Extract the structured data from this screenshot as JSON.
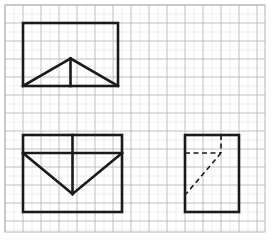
{
  "canvas": {
    "width": 271,
    "height": 240,
    "background": "#ffffff"
  },
  "grid": {
    "name": "square-grid-paper",
    "origin_x": 5,
    "origin_y": 5,
    "frame_width": 260,
    "frame_height": 227,
    "cell_size": 18,
    "sub_divisions": 2,
    "major_line_color": "#b9b9bd",
    "minor_line_color": "#dedee2",
    "frame_color": "#b4b4b8",
    "major_line_width": 0.9,
    "minor_line_width": 0.45,
    "frame_line_width": 1.0
  },
  "style": {
    "stroke_color": "#1a1a1a",
    "solid_stroke_width": 2.6,
    "dashed_stroke_width": 1.6,
    "dash_pattern": "5,3.5",
    "line_cap": "square",
    "fill": "none"
  },
  "figures": [
    {
      "id": "figure-top-left",
      "label": "Rectangle with inscribed isosceles triangle and median",
      "kind": "rectangle-with-triangle",
      "outline": {
        "name": "top-left-rectangle",
        "x": 23,
        "y": 23,
        "width": 95,
        "height": 63,
        "style": "solid"
      },
      "segments": [
        {
          "name": "triangle-left-leg",
          "x1": 23,
          "y1": 86,
          "x2": 70.5,
          "y2": 58.5,
          "style": "solid"
        },
        {
          "name": "triangle-right-leg",
          "x1": 70.5,
          "y1": 58.5,
          "x2": 118,
          "y2": 86,
          "style": "solid"
        },
        {
          "name": "triangle-median-vertical",
          "x1": 70.5,
          "y1": 58.5,
          "x2": 70.5,
          "y2": 86,
          "style": "solid"
        }
      ]
    },
    {
      "id": "figure-bottom-left",
      "label": "Square with top band and inverted V triangle",
      "kind": "square-with-inverted-triangle",
      "outline": {
        "name": "bottom-left-square",
        "x": 23,
        "y": 135,
        "width": 99,
        "height": 77,
        "style": "solid"
      },
      "segments": [
        {
          "name": "horizontal-band-line",
          "x1": 23,
          "y1": 153,
          "x2": 122,
          "y2": 153,
          "style": "solid"
        },
        {
          "name": "vertical-center-line",
          "x1": 72.5,
          "y1": 135,
          "x2": 72.5,
          "y2": 194,
          "style": "solid"
        },
        {
          "name": "inverted-triangle-left-leg",
          "x1": 23,
          "y1": 153,
          "x2": 72.5,
          "y2": 194,
          "style": "solid"
        },
        {
          "name": "inverted-triangle-right-leg",
          "x1": 72.5,
          "y1": 194,
          "x2": 122,
          "y2": 153,
          "style": "solid"
        }
      ]
    },
    {
      "id": "figure-bottom-right",
      "label": "Rectangle with hidden dashed construction lines",
      "kind": "rectangle-with-dashed-lines",
      "outline": {
        "name": "bottom-right-rectangle",
        "x": 185,
        "y": 135,
        "width": 54,
        "height": 77,
        "style": "solid"
      },
      "segments": [
        {
          "name": "dashed-horizontal-line",
          "x1": 185,
          "y1": 153,
          "x2": 221,
          "y2": 153,
          "style": "dashed"
        },
        {
          "name": "dashed-vertical-line",
          "x1": 221,
          "y1": 135,
          "x2": 221,
          "y2": 153,
          "style": "dashed"
        },
        {
          "name": "dashed-diagonal-line",
          "x1": 221,
          "y1": 153,
          "x2": 186,
          "y2": 194,
          "style": "dashed"
        }
      ]
    }
  ]
}
